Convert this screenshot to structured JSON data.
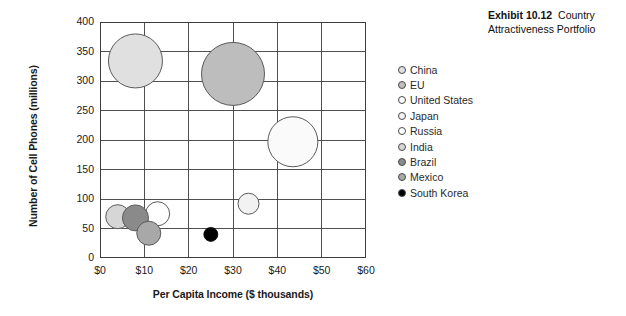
{
  "exhibit": {
    "number_label": "Exhibit 10.12",
    "title": "Country Attractiveness Portfolio"
  },
  "legend": {
    "position": "right",
    "items": [
      {
        "label": "China",
        "color": "#e0e0e0"
      },
      {
        "label": "EU",
        "color": "#bdbdbd"
      },
      {
        "label": "United States",
        "color": "#fafafa"
      },
      {
        "label": "Japan",
        "color": "#f2f2f2"
      },
      {
        "label": "Russia",
        "color": "#ffffff"
      },
      {
        "label": "India",
        "color": "#d6d6d6"
      },
      {
        "label": "Brazil",
        "color": "#8a8a8a"
      },
      {
        "label": "Mexico",
        "color": "#a8a8a8"
      },
      {
        "label": "South Korea",
        "color": "#000000"
      }
    ]
  },
  "chart_data": {
    "type": "scatter",
    "title": "Country Attractiveness Portfolio",
    "xlabel": "Per Capita Income ($ thousands)",
    "ylabel": "Number of Cell Phones (millions)",
    "xlim": [
      0,
      60
    ],
    "ylim": [
      0,
      400
    ],
    "grid": true,
    "xticks": [
      0,
      10,
      20,
      30,
      40,
      50,
      60
    ],
    "xticklabels": [
      "$0",
      "$10",
      "$20",
      "$30",
      "$40",
      "$50",
      "$60"
    ],
    "yticks": [
      0,
      50,
      100,
      150,
      200,
      250,
      300,
      350,
      400
    ],
    "yticklabels": [
      "0",
      "50",
      "100",
      "150",
      "200",
      "250",
      "300",
      "350",
      "400"
    ],
    "points": [
      {
        "name": "China",
        "x": 8,
        "y": 334,
        "r": 27,
        "color": "#e0e0e0"
      },
      {
        "name": "EU",
        "x": 30,
        "y": 312,
        "r": 31.5,
        "color": "#bdbdbd"
      },
      {
        "name": "United States",
        "x": 43.5,
        "y": 197,
        "r": 25,
        "color": "#fafafa"
      },
      {
        "name": "Japan",
        "x": 33.5,
        "y": 92,
        "r": 10.5,
        "color": "#f2f2f2"
      },
      {
        "name": "Russia",
        "x": 13,
        "y": 75,
        "r": 12,
        "color": "#ffffff"
      },
      {
        "name": "India",
        "x": 4,
        "y": 70,
        "r": 12,
        "color": "#d6d6d6"
      },
      {
        "name": "Brazil",
        "x": 8,
        "y": 68,
        "r": 13,
        "color": "#8a8a8a"
      },
      {
        "name": "Mexico",
        "x": 11,
        "y": 42,
        "r": 12,
        "color": "#a8a8a8"
      },
      {
        "name": "South Korea",
        "x": 25,
        "y": 40,
        "r": 7,
        "color": "#000000"
      }
    ]
  }
}
